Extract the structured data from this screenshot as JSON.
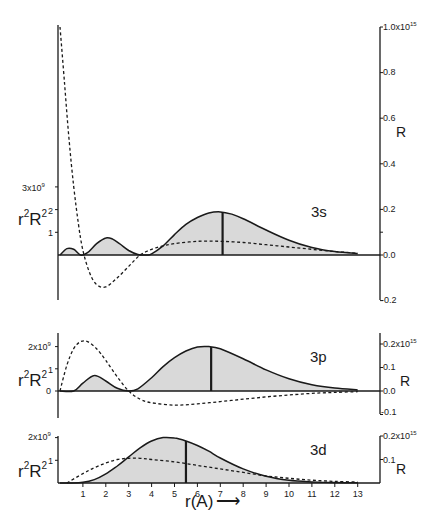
{
  "chart_data": [
    {
      "type": "area",
      "title": "3s",
      "xlabel": "r(A)",
      "ylabel_left": "r²R²",
      "ylabel_right": "R",
      "xlim": [
        0,
        14
      ],
      "ylim_left": [
        -0.3,
        3
      ],
      "ylim_left_unit": "x10^9",
      "ylim_right": [
        -0.2,
        1.0
      ],
      "ylim_right_unit": "x10^15",
      "left_ticks": [
        "",
        "1",
        "2",
        "3x10⁹"
      ],
      "right_ticks": [
        "-0.2",
        "0.0",
        "0.2",
        "0.4",
        "0.6",
        "0.8",
        "1.0x10¹⁵"
      ],
      "series": [
        {
          "name": "r²R² (shaded, solid)",
          "style": "solid-filled",
          "x": [
            0,
            0.3,
            0.6,
            0.9,
            1.2,
            1.6,
            2.0,
            2.3,
            2.6,
            3.0,
            3.4,
            3.8,
            4.0,
            4.5,
            5.0,
            5.5,
            6.0,
            6.5,
            7.0,
            7.5,
            8.0,
            9.0,
            10.0,
            11.0,
            12.0,
            13.0,
            14.0
          ],
          "y": [
            0,
            0.28,
            0.25,
            0,
            0.1,
            0.5,
            0.75,
            0.7,
            0.5,
            0.2,
            0.02,
            0,
            0.05,
            0.4,
            0.9,
            1.35,
            1.65,
            1.85,
            1.9,
            1.8,
            1.6,
            1.1,
            0.65,
            0.33,
            0.15,
            0.06,
            0.02
          ]
        },
        {
          "name": "R (dashed)",
          "style": "dashed",
          "x": [
            0,
            0.2,
            0.4,
            0.6,
            0.8,
            1.0,
            1.3,
            1.6,
            2.0,
            2.5,
            3.0,
            3.5,
            4.0,
            4.5,
            5.0,
            6.0,
            7.0,
            8.0,
            9.0,
            10.0,
            11.0,
            12.0,
            13.0,
            14.0
          ],
          "y": [
            1.0,
            0.75,
            0.5,
            0.3,
            0.14,
            0.02,
            -0.08,
            -0.13,
            -0.14,
            -0.1,
            -0.05,
            0.0,
            0.025,
            0.04,
            0.05,
            0.06,
            0.06,
            0.055,
            0.045,
            0.035,
            0.025,
            0.015,
            0.008,
            0.003
          ]
        }
      ],
      "annotations": [
        "vertical line at r ≈ 7.1 Å (average radius)"
      ]
    },
    {
      "type": "area",
      "title": "3p",
      "xlabel": "r(A)",
      "ylabel_left": "r²R²",
      "ylabel_right": "R",
      "xlim": [
        0,
        14
      ],
      "ylim_left": [
        -0.5,
        2.5
      ],
      "ylim_left_unit": "x10^9",
      "ylim_right": [
        -0.1,
        0.25
      ],
      "ylim_right_unit": "x10^15",
      "left_ticks": [
        "0",
        "1",
        "2x10⁹"
      ],
      "right_ticks": [
        "-0.1",
        "0.0",
        "0.1",
        "0.2x10¹⁵"
      ],
      "series": [
        {
          "name": "r²R² (shaded, solid)",
          "style": "solid-filled",
          "x": [
            0,
            0.6,
            1.0,
            1.5,
            2.0,
            2.5,
            3.0,
            3.4,
            4.0,
            4.5,
            5.0,
            5.5,
            6.0,
            6.5,
            7.0,
            8.0,
            9.0,
            10.0,
            11.0,
            12.0,
            13.0,
            14.0
          ],
          "y": [
            0,
            0,
            0.35,
            0.7,
            0.45,
            0.12,
            0,
            0.1,
            0.6,
            1.1,
            1.5,
            1.8,
            1.98,
            2.0,
            1.9,
            1.45,
            0.95,
            0.55,
            0.28,
            0.13,
            0.05,
            0.02
          ]
        },
        {
          "name": "R (dashed)",
          "style": "dashed",
          "x": [
            0,
            0.3,
            0.6,
            0.9,
            1.2,
            1.6,
            2.0,
            2.5,
            3.0,
            3.5,
            4.0,
            5.0,
            6.0,
            7.0,
            8.0,
            9.0,
            10.0,
            11.0,
            12.0,
            13.0,
            14.0
          ],
          "y": [
            0,
            0.11,
            0.18,
            0.21,
            0.21,
            0.18,
            0.13,
            0.06,
            0.0,
            -0.035,
            -0.05,
            -0.06,
            -0.055,
            -0.045,
            -0.035,
            -0.025,
            -0.017,
            -0.01,
            -0.006,
            -0.003,
            -0.001
          ]
        }
      ],
      "annotations": [
        "vertical line at r ≈ 6.6 Å (average radius)"
      ]
    },
    {
      "type": "area",
      "title": "3d",
      "xlabel": "r(A)",
      "ylabel_left": "r²R²",
      "ylabel_right": "R",
      "xlim": [
        0,
        14
      ],
      "ylim_left": [
        0,
        2.2
      ],
      "ylim_left_unit": "x10^9",
      "ylim_right": [
        0,
        0.22
      ],
      "ylim_right_unit": "x10^15",
      "left_ticks": [
        "1",
        "2x10⁹"
      ],
      "right_ticks": [
        "0.1",
        "0.2x10¹⁵"
      ],
      "x_ticks": [
        "1",
        "2",
        "3",
        "4",
        "5",
        "6",
        "7",
        "8",
        "9",
        "10",
        "11",
        "12",
        "13"
      ],
      "series": [
        {
          "name": "r²R² (shaded, solid)",
          "style": "solid-filled",
          "x": [
            0,
            0.5,
            1.0,
            1.5,
            2.0,
            2.5,
            3.0,
            3.5,
            4.0,
            4.5,
            5.0,
            5.5,
            6.0,
            6.5,
            7.0,
            8.0,
            9.0,
            10.0,
            11.0,
            12.0,
            13.0,
            14.0
          ],
          "y": [
            0,
            0,
            0.03,
            0.15,
            0.4,
            0.75,
            1.15,
            1.55,
            1.85,
            2.0,
            1.98,
            1.85,
            1.65,
            1.4,
            1.1,
            0.62,
            0.3,
            0.12,
            0.05,
            0.02,
            0.01,
            0.0
          ]
        },
        {
          "name": "R (dashed)",
          "style": "dashed",
          "x": [
            0.3,
            1.0,
            1.5,
            2.0,
            2.5,
            3.0,
            3.5,
            4.0,
            5.0,
            6.0,
            7.0,
            8.0,
            9.0,
            10.0,
            11.0,
            12.0,
            13.0,
            14.0
          ],
          "y": [
            0,
            0.04,
            0.065,
            0.085,
            0.1,
            0.105,
            0.105,
            0.1,
            0.09,
            0.075,
            0.06,
            0.045,
            0.03,
            0.02,
            0.012,
            0.007,
            0.004,
            0.002
          ]
        }
      ],
      "annotations": [
        "vertical line at r ≈ 5.5 Å (average radius)"
      ]
    }
  ],
  "labels": {
    "panel_3s": {
      "orbital": "3s",
      "left_axis_title_base": "r",
      "left_axis_title_sup1": "2",
      "left_axis_title_mid": "R",
      "left_axis_title_sup2": "2",
      "left_tick_top": "3x10",
      "left_tick_top_exp": "9",
      "left_tick_2": "2",
      "left_tick_1": "1",
      "right_title": "R",
      "right_ticks": {
        "t10": "1.0x10",
        "t10_exp": "15",
        "t08": "0.8",
        "t06": "0.6",
        "t04": "0.4",
        "t02": "0.2",
        "t00": "0.0",
        "tm02": "-0.2"
      }
    },
    "panel_3p": {
      "orbital": "3p",
      "left_tick_top": "2x10",
      "left_tick_top_exp": "9",
      "left_tick_1": "1",
      "left_tick_0": "0",
      "right_title": "R",
      "right_ticks": {
        "t02": "0.2x10",
        "t02_exp": "15",
        "t01": "0.1",
        "t00": "0.0",
        "tm01": "-0.1"
      }
    },
    "panel_3d": {
      "orbital": "3d",
      "left_tick_top": "2x10",
      "left_tick_top_exp": "9",
      "left_tick_1": "1",
      "right_title": "R",
      "right_ticks": {
        "t02": "0.2x10",
        "t02_exp": "15",
        "t01": "0.1"
      }
    },
    "x_axis": {
      "title": "r(A)",
      "arrow": "⟶",
      "ticks": [
        "1",
        "2",
        "3",
        "4",
        "5",
        "6",
        "7",
        "8",
        "9",
        "10",
        "11",
        "12",
        "13"
      ]
    }
  },
  "colors": {
    "ink": "#1a1a1a",
    "fill": "#d9d9d9",
    "background": "#ffffff"
  }
}
